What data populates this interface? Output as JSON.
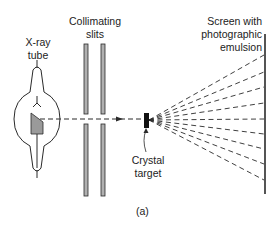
{
  "labels": {
    "xray_tube": [
      "X-ray",
      "tube"
    ],
    "collimating_slits": [
      "Collimating",
      "slits"
    ],
    "screen": [
      "Screen with",
      "photographic",
      "emulsion"
    ],
    "crystal": [
      "Crystal",
      "target"
    ],
    "caption": "(a)"
  },
  "colors": {
    "line": "#2a2a2a",
    "fill_gray": "#9a9a9a"
  },
  "diffracted_rays_screen_y": [
    55,
    72,
    87,
    103,
    119,
    134,
    149,
    164,
    180
  ]
}
